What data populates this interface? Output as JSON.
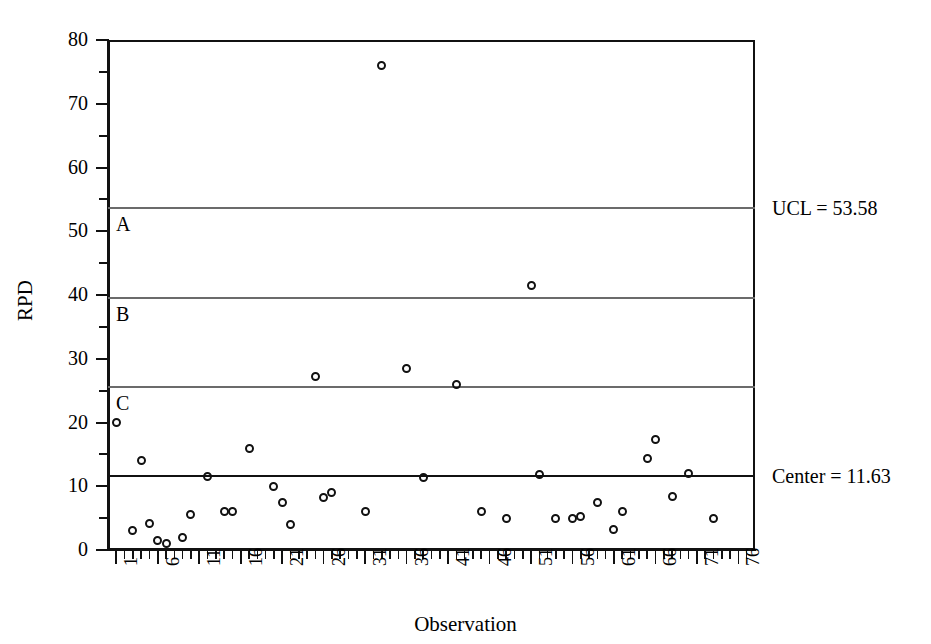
{
  "chart_data": {
    "type": "scatter",
    "title": "",
    "xlabel": "Observation",
    "ylabel": "RPD",
    "xlim": [
      0,
      78
    ],
    "ylim": [
      0,
      80
    ],
    "grid": false,
    "legend": "none",
    "y_ticks_major": [
      0,
      10,
      20,
      30,
      40,
      50,
      60,
      70,
      80
    ],
    "y_ticks_minor": [
      5,
      15,
      25,
      35,
      45,
      55,
      65,
      75
    ],
    "x_ticks_major": [
      1,
      6,
      11,
      16,
      21,
      26,
      31,
      36,
      41,
      46,
      51,
      56,
      61,
      66,
      71,
      76
    ],
    "x_tick_labels": [
      "1",
      "6",
      "11",
      "16",
      "21",
      "26",
      "31",
      "36",
      "41",
      "46",
      "51",
      "56",
      "61",
      "66",
      "71",
      "76"
    ],
    "x_tick_minor_step": 1,
    "control_limits": {
      "ucl": 53.58,
      "center": 11.63,
      "zone_a_lower": 39.59,
      "zone_b_lower": 25.61
    },
    "annotations": [
      {
        "name": "ucl-annotation",
        "label": "UCL = 53.58",
        "value": 53.58
      },
      {
        "name": "center-annotation",
        "label": "Center = 11.63",
        "value": 11.63
      }
    ],
    "zone_labels": [
      {
        "name": "zone-label-a",
        "label": "A",
        "top_value": 53.58
      },
      {
        "name": "zone-label-b",
        "label": "B",
        "top_value": 39.59
      },
      {
        "name": "zone-label-c",
        "label": "C",
        "top_value": 25.61
      }
    ],
    "x": [
      1,
      3,
      4,
      5,
      6,
      7,
      9,
      11,
      12,
      13,
      14,
      16,
      17,
      19,
      20,
      21,
      22,
      24,
      25,
      26,
      28,
      29,
      31,
      33,
      36,
      37,
      39,
      41,
      43,
      47,
      49,
      51,
      52,
      54,
      55,
      56,
      57,
      59,
      60,
      61,
      62,
      64,
      65,
      66,
      67,
      69,
      71,
      73
    ],
    "values": [
      20.0,
      3.0,
      4.1,
      1.5,
      1.0,
      2.0,
      5.5,
      11.5,
      6.0,
      6.1,
      16.0,
      27.2,
      10.0,
      7.5,
      4.0,
      8.3,
      9.0,
      28.4,
      6.0,
      11.3,
      26.0,
      6.0,
      41.5,
      11.8,
      5.0,
      5.0,
      5.2,
      7.5,
      3.2,
      6.0,
      14.4,
      17.4,
      8.4,
      12.0,
      5.0,
      76.0,
      0,
      0,
      0,
      0,
      0,
      0,
      0,
      0,
      0,
      0,
      0,
      0
    ],
    "points": [
      {
        "x": 1,
        "y": 20.0
      },
      {
        "x": 3,
        "y": 3.0
      },
      {
        "x": 4,
        "y": 14.0
      },
      {
        "x": 5,
        "y": 4.1
      },
      {
        "x": 6,
        "y": 1.5
      },
      {
        "x": 7,
        "y": 1.0
      },
      {
        "x": 9,
        "y": 2.0
      },
      {
        "x": 10,
        "y": 5.5
      },
      {
        "x": 12,
        "y": 11.5
      },
      {
        "x": 14,
        "y": 6.0
      },
      {
        "x": 15,
        "y": 6.1
      },
      {
        "x": 17,
        "y": 16.0
      },
      {
        "x": 20,
        "y": 10.0
      },
      {
        "x": 21,
        "y": 7.5
      },
      {
        "x": 22,
        "y": 4.0
      },
      {
        "x": 25,
        "y": 27.2
      },
      {
        "x": 26,
        "y": 8.3
      },
      {
        "x": 27,
        "y": 9.0
      },
      {
        "x": 31,
        "y": 6.0
      },
      {
        "x": 33,
        "y": 76.0
      },
      {
        "x": 36,
        "y": 28.4
      },
      {
        "x": 38,
        "y": 11.3
      },
      {
        "x": 42,
        "y": 26.0
      },
      {
        "x": 45,
        "y": 6.0
      },
      {
        "x": 48,
        "y": 5.0
      },
      {
        "x": 51,
        "y": 41.5
      },
      {
        "x": 52,
        "y": 11.8
      },
      {
        "x": 54,
        "y": 5.0
      },
      {
        "x": 56,
        "y": 5.0
      },
      {
        "x": 57,
        "y": 5.2
      },
      {
        "x": 59,
        "y": 7.5
      },
      {
        "x": 61,
        "y": 3.2
      },
      {
        "x": 62,
        "y": 6.0
      },
      {
        "x": 65,
        "y": 14.4
      },
      {
        "x": 66,
        "y": 17.4
      },
      {
        "x": 68,
        "y": 8.4
      },
      {
        "x": 70,
        "y": 12.0
      },
      {
        "x": 73,
        "y": 5.0
      }
    ]
  }
}
